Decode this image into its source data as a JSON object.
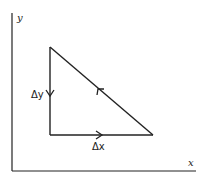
{
  "diagram": {
    "axes": {
      "x_label": "x",
      "y_label": "y"
    },
    "triangle": {
      "vertices": {
        "top": [
          50,
          47
        ],
        "bottom_left": [
          50,
          135
        ],
        "bottom_right": [
          153,
          135
        ]
      },
      "edges": [
        {
          "name": "vertical",
          "label": "Δy",
          "direction": "down"
        },
        {
          "name": "horizontal",
          "label": "Δx",
          "direction": "right"
        },
        {
          "name": "hypotenuse",
          "label": "",
          "direction": "up-left"
        }
      ]
    },
    "labels": {
      "delta_y": "Δy",
      "delta_x": "Δx"
    },
    "colors": {
      "line": "#222222",
      "background": "#ffffff"
    }
  }
}
